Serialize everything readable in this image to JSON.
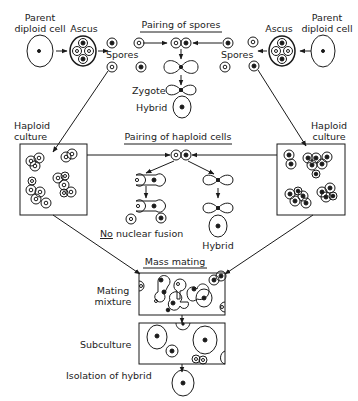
{
  "diagram": {
    "top_left": {
      "parent_label_1": "Parent",
      "parent_label_2": "diploid cell",
      "ascus": "Ascus",
      "spores": "Spores"
    },
    "top_right": {
      "parent_label_1": "Parent",
      "parent_label_2": "diploid cell",
      "ascus": "Ascus",
      "spores": "Spores"
    },
    "pairing_spores": {
      "title": "Pairing of spores",
      "zygote": "Zygote",
      "hybrid": "Hybrid"
    },
    "haploid_left": {
      "label_1": "Haploid",
      "label_2": "culture"
    },
    "haploid_right": {
      "label_1": "Haploid",
      "label_2": "culture"
    },
    "pairing_haploid": {
      "title": "Pairing of haploid cells",
      "no_fusion_prefix": "No",
      "no_fusion_rest": " nuclear fusion",
      "hybrid": "Hybrid"
    },
    "mass_mating": {
      "title": "Mass mating",
      "mixture_1": "Mating",
      "mixture_2": "mixture",
      "subculture": "Subculture",
      "isolation": "Isolation of hybrid"
    }
  },
  "colors": {
    "ink": "#1a1a1a",
    "background": "#ffffff"
  }
}
